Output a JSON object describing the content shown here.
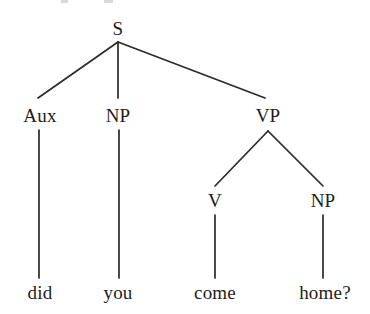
{
  "figure": {
    "kind": "syntax-tree",
    "sentence": "did you come home?",
    "background_color": "#ffffff",
    "line_color": "#2a2a2a",
    "text_color": "#1d1d1d"
  },
  "nodes": {
    "s": {
      "label": "S",
      "x": 118,
      "y": 28
    },
    "aux": {
      "label": "Aux",
      "x": 40,
      "y": 115
    },
    "np1": {
      "label": "NP",
      "x": 118,
      "y": 115
    },
    "vp": {
      "label": "VP",
      "x": 268,
      "y": 115
    },
    "v": {
      "label": "V",
      "x": 215,
      "y": 200
    },
    "np2": {
      "label": "NP",
      "x": 323,
      "y": 200
    }
  },
  "leaves": {
    "did": {
      "label": "did",
      "x": 40,
      "y": 292
    },
    "you": {
      "label": "you",
      "x": 118,
      "y": 292
    },
    "come": {
      "label": "come",
      "x": 215,
      "y": 292
    },
    "home": {
      "label": "home?",
      "x": 325,
      "y": 292
    }
  },
  "edges": [
    {
      "name": "s-to-aux",
      "from": "S",
      "to": "Aux",
      "x1": 118,
      "y1": 42,
      "x2": 38,
      "y2": 98
    },
    {
      "name": "s-to-np",
      "from": "S",
      "to": "NP",
      "x1": 118,
      "y1": 42,
      "x2": 118,
      "y2": 98
    },
    {
      "name": "s-to-vp",
      "from": "S",
      "to": "VP",
      "x1": 118,
      "y1": 42,
      "x2": 265,
      "y2": 98
    },
    {
      "name": "aux-to-did",
      "from": "Aux",
      "to": "did",
      "x1": 39,
      "y1": 130,
      "x2": 39,
      "y2": 278
    },
    {
      "name": "np-to-you",
      "from": "NP",
      "to": "you",
      "x1": 119,
      "y1": 130,
      "x2": 119,
      "y2": 278
    },
    {
      "name": "vp-to-v",
      "from": "VP",
      "to": "V",
      "x1": 268,
      "y1": 131,
      "x2": 215,
      "y2": 186
    },
    {
      "name": "vp-to-np",
      "from": "VP",
      "to": "NP",
      "x1": 268,
      "y1": 131,
      "x2": 323,
      "y2": 186
    },
    {
      "name": "v-to-come",
      "from": "V",
      "to": "come",
      "x1": 215,
      "y1": 215,
      "x2": 215,
      "y2": 278
    },
    {
      "name": "np-to-home",
      "from": "NP",
      "to": "home?",
      "x1": 323,
      "y1": 215,
      "x2": 323,
      "y2": 278
    }
  ]
}
